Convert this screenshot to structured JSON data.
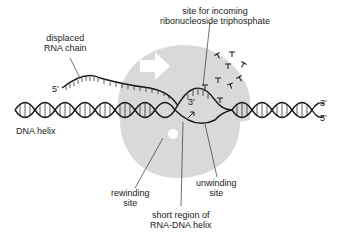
{
  "labels": {
    "displaced_rna": [
      "displaced",
      "RNA chain"
    ],
    "incoming_site": [
      "site for incoming",
      "ribonucleoside triphosphate"
    ],
    "dna_helix": "DNA helix",
    "rewinding_site": [
      "rewinding",
      "site"
    ],
    "short_region": [
      "short region of",
      "RNA-DNA helix"
    ],
    "unwinding_site": [
      "unwinding",
      "site"
    ]
  },
  "ends": {
    "rna_5prime": "5′",
    "rna_3prime": "3′",
    "dna_right_top": "3′",
    "dna_right_bottom": "5′"
  },
  "colors": {
    "polymerase": "#d9d9d9",
    "strand": "#1a1a1a",
    "arrow": "#ffffff"
  }
}
